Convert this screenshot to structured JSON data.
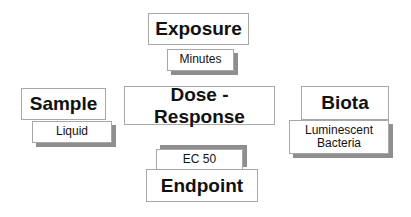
{
  "diagram": {
    "background_color": "#ffffff",
    "border_color": "#a8a8a8",
    "shadow_color": "#8e8e8e",
    "text_color": "#111111",
    "nodes": {
      "exposure": {
        "label": "Exposure",
        "role": "primary"
      },
      "minutes": {
        "label": "Minutes",
        "role": "secondary"
      },
      "sample": {
        "label": "Sample",
        "role": "primary"
      },
      "liquid": {
        "label": "Liquid",
        "role": "secondary"
      },
      "dose_response": {
        "label": "Dose - Response",
        "role": "primary"
      },
      "biota": {
        "label": "Biota",
        "role": "primary"
      },
      "bacteria": {
        "label": "Luminescent\nBacteria",
        "role": "secondary"
      },
      "ec50": {
        "label": "EC 50",
        "role": "secondary"
      },
      "endpoint": {
        "label": "Endpoint",
        "role": "primary"
      }
    }
  }
}
